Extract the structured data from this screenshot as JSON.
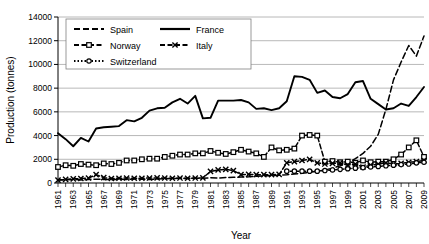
{
  "chart_data": {
    "type": "line",
    "title": "",
    "xlabel": "Year",
    "ylabel": "Production (tonnes)",
    "xlim": [
      1961,
      2009
    ],
    "ylim": [
      0,
      14000
    ],
    "yticks": [
      0,
      2000,
      4000,
      6000,
      8000,
      10000,
      12000,
      14000
    ],
    "ytick_labels": [
      "0",
      "2000",
      "4000",
      "6000",
      "8000",
      "10000",
      "12000",
      "14000"
    ],
    "grid": "horizontal",
    "legend_position": "top-left-inside",
    "x": [
      1961,
      1962,
      1963,
      1964,
      1965,
      1966,
      1967,
      1968,
      1969,
      1970,
      1971,
      1972,
      1973,
      1974,
      1975,
      1976,
      1977,
      1978,
      1979,
      1980,
      1981,
      1982,
      1983,
      1984,
      1985,
      1986,
      1987,
      1988,
      1989,
      1990,
      1991,
      1992,
      1993,
      1994,
      1995,
      1996,
      1997,
      1998,
      1999,
      2000,
      2001,
      2002,
      2003,
      2004,
      2005,
      2006,
      2007,
      2008,
      2009
    ],
    "xtick_labels": [
      "1961",
      "1963",
      "1965",
      "1967",
      "1969",
      "1971",
      "1973",
      "1975",
      "1977",
      "1979",
      "1981",
      "1983",
      "1985",
      "1987",
      "1989",
      "1991",
      "1993",
      "1995",
      "1997",
      "1999",
      "2001",
      "2003",
      "2005",
      "2007",
      "2009"
    ],
    "series": [
      {
        "name": "Spain",
        "style": "dashed",
        "marker": "none",
        "color": "#000000",
        "values": [
          260,
          280,
          300,
          260,
          300,
          320,
          300,
          280,
          320,
          300,
          340,
          320,
          300,
          340,
          360,
          380,
          400,
          380,
          420,
          400,
          440,
          420,
          460,
          480,
          500,
          520,
          560,
          600,
          620,
          660,
          700,
          760,
          820,
          900,
          980,
          1100,
          1250,
          1450,
          1700,
          2050,
          2500,
          3100,
          4100,
          6200,
          8700,
          10200,
          11600,
          10700,
          12400
        ]
      },
      {
        "name": "France",
        "style": "solid",
        "marker": "none",
        "color": "#000000",
        "values": [
          4200,
          3700,
          3100,
          3800,
          3500,
          4600,
          4700,
          4750,
          4800,
          5300,
          5200,
          5500,
          6100,
          6300,
          6350,
          6800,
          7100,
          6700,
          7350,
          5450,
          5500,
          6950,
          6950,
          6950,
          7000,
          6800,
          6250,
          6300,
          6150,
          6300,
          6900,
          9000,
          8950,
          8700,
          7600,
          7800,
          7250,
          7150,
          7500,
          8500,
          8600,
          7100,
          6650,
          6200,
          6300,
          6700,
          6500,
          7250,
          8100
        ]
      },
      {
        "name": "Norway",
        "style": "dash-marker",
        "marker": "square",
        "color": "#000000",
        "values": [
          1350,
          1500,
          1450,
          1600,
          1550,
          1500,
          1650,
          1600,
          1700,
          1900,
          1900,
          2000,
          2050,
          2050,
          2200,
          2300,
          2400,
          2400,
          2500,
          2500,
          2700,
          2550,
          2450,
          2600,
          2800,
          2650,
          2500,
          2200,
          3000,
          2750,
          2800,
          2900,
          4000,
          4050,
          4000,
          1800,
          1850,
          1750,
          1800,
          1700,
          1900,
          1750,
          1800,
          1800,
          2000,
          2400,
          3000,
          3600,
          2200
        ]
      },
      {
        "name": "Italy",
        "style": "dash-marker",
        "marker": "cross",
        "color": "#000000",
        "values": [
          250,
          300,
          350,
          380,
          420,
          700,
          450,
          380,
          400,
          420,
          400,
          400,
          420,
          430,
          420,
          400,
          420,
          400,
          420,
          430,
          980,
          1100,
          1150,
          1050,
          700,
          720,
          700,
          700,
          700,
          720,
          1700,
          1800,
          1900,
          2000,
          1700,
          1600,
          1650,
          1700,
          1500,
          1600,
          1350,
          1500,
          1600,
          1700,
          1600,
          1650,
          1750,
          1800,
          1900
        ]
      },
      {
        "name": "Switzerland",
        "style": "dotted-marker",
        "marker": "circle",
        "color": "#000000",
        "values": [
          null,
          null,
          null,
          null,
          null,
          null,
          null,
          null,
          null,
          null,
          null,
          null,
          null,
          null,
          null,
          null,
          null,
          null,
          null,
          null,
          null,
          null,
          null,
          null,
          null,
          null,
          null,
          null,
          null,
          null,
          1000,
          1000,
          1000,
          1000,
          1000,
          1050,
          1100,
          1150,
          1200,
          1250,
          1300,
          1350,
          1400,
          1450,
          1500,
          1550,
          1600,
          1700,
          1750
        ]
      }
    ]
  },
  "legend": {
    "entries": [
      {
        "label": "Spain"
      },
      {
        "label": "France"
      },
      {
        "label": "Norway"
      },
      {
        "label": "Italy"
      },
      {
        "label": "Switzerland"
      }
    ]
  }
}
